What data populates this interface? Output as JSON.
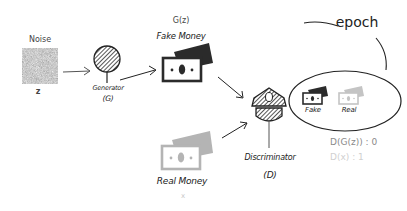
{
  "noise": {
    "label": "Noise",
    "symbol": "z"
  },
  "generator": {
    "label": "Generator",
    "abbr": "(G)"
  },
  "fake_money": {
    "formula": "G(z)",
    "label": "Fake Money"
  },
  "real_money": {
    "label": "Real Money",
    "symbol": "x"
  },
  "discriminator": {
    "label": "Discriminator",
    "abbr": "(D)"
  },
  "epoch": {
    "label": "epoch"
  },
  "evaluation": {
    "fake_label": "Fake",
    "real_label": "Real",
    "fake_score": "D(G(z)) : 0",
    "real_score": "D(x) : 1"
  },
  "colors": {
    "ink": "#222222",
    "fake_bill": "#2b2b2b",
    "real_bill": "#b4b4b4",
    "noise": "#9a9a9a",
    "faded_text": "#c8c8c8",
    "score_text": "#8a8a8a"
  }
}
